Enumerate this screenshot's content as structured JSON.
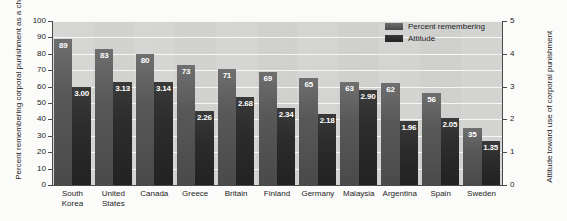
{
  "chart_data": {
    "type": "bar",
    "title": "",
    "subtitle": "",
    "xlabel": "",
    "ylabel": "Percent remembering corporal punishment as a child",
    "y2label": "Attitude toward use of corporal punishment",
    "ylim": [
      0,
      100
    ],
    "y2lim": [
      0,
      5
    ],
    "yticks": [
      "0",
      "10",
      "20",
      "30",
      "40",
      "50",
      "60",
      "70",
      "80",
      "90",
      "100"
    ],
    "y2ticks": [
      "0",
      "1",
      "2",
      "3",
      "4",
      "5"
    ],
    "grid": true,
    "legend_position": "top-right",
    "categories": [
      "South Korea",
      "United States",
      "Canada",
      "Greece",
      "Britain",
      "Finland",
      "Germany",
      "Malaysia",
      "Argentina",
      "Spain",
      "Sweden"
    ],
    "category_lines": [
      [
        "South",
        "Korea"
      ],
      [
        "United",
        "States"
      ],
      [
        "Canada",
        ""
      ],
      [
        "Greece",
        ""
      ],
      [
        "Britain",
        ""
      ],
      [
        "Finland",
        ""
      ],
      [
        "Germany",
        ""
      ],
      [
        "Malaysia",
        ""
      ],
      [
        "Argentina",
        ""
      ],
      [
        "Spain",
        ""
      ],
      [
        "Sweden",
        ""
      ]
    ],
    "series": [
      {
        "name": "Percent remembering",
        "axis": "left",
        "color": "#585858",
        "values": [
          89,
          83,
          80,
          73,
          71,
          69,
          65,
          63,
          62,
          56,
          35
        ],
        "labels": [
          "89",
          "83",
          "80",
          "73",
          "71",
          "69",
          "65",
          "63",
          "62",
          "56",
          "35"
        ]
      },
      {
        "name": "Attitude",
        "axis": "right",
        "color": "#2c2c2c",
        "values": [
          3.0,
          3.13,
          3.14,
          2.26,
          2.68,
          2.34,
          2.18,
          2.9,
          1.96,
          2.05,
          1.35
        ],
        "labels": [
          "3.00",
          "3.13",
          "3.14",
          "2.26",
          "2.68",
          "2.34",
          "2.18",
          "2.90",
          "1.96",
          "2.05",
          "1.35"
        ]
      }
    ],
    "legend": [
      "Percent remembering",
      "Attitude"
    ]
  },
  "colors": {
    "page_background": "#fbfbfa",
    "plot_background": "#d0d0ce",
    "gridline": "#ffffff",
    "axis": "#4a4a4a",
    "text": "#1b1b1b",
    "series_percent": "#585858",
    "series_attitude": "#2c2c2c",
    "value_label": "#ffffff"
  }
}
